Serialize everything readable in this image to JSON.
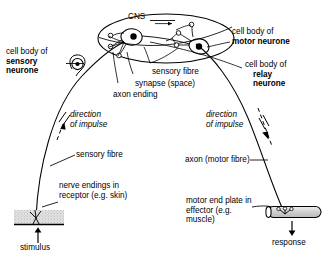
{
  "diagram": {
    "type": "biology-labelled-diagram",
    "colors": {
      "stroke": "#000000",
      "background": "#ffffff",
      "receptor_fill": "#d9d9d9",
      "effector_fill": "#d0d0d0",
      "cell_body_fill": "#000000"
    }
  },
  "labels": {
    "cns": "CNS",
    "cell_body_sensory": {
      "line1": "cell body of",
      "line2": "sensory",
      "line3": "neurone"
    },
    "cell_body_motor": {
      "line1": "cell body of",
      "line2": "motor neurone"
    },
    "cell_body_relay": {
      "line1": "cell body of",
      "line2": "relay",
      "line3": "neurone"
    },
    "sensory_fibre_cns": "sensory fibre",
    "synapse": "synapse (space)",
    "axon_ending": "axon ending",
    "direction_left": {
      "line1": "direction",
      "line2": "of impulse"
    },
    "direction_right": {
      "line1": "direction",
      "line2": "of impulse"
    },
    "sensory_fibre": "sensory fibre",
    "axon_motor_fibre": "axon (motor fibre)",
    "nerve_endings": {
      "line1": "nerve endings in",
      "line2": "receptor (e.g. skin)"
    },
    "motor_end_plate": {
      "line1": "motor end plate in",
      "line2": "effector (e.g.",
      "line3": "muscle)"
    },
    "stimulus": "stimulus",
    "response": "response"
  },
  "icons": {
    "cns_arrow": "arrow-right-icon",
    "stimulus_arrow": "arrow-up-icon",
    "response_arrow": "arrow-down-icon",
    "impulse_arrow_left": "arrow-up-icon",
    "impulse_arrow_right": "arrow-down-icon"
  },
  "structures": {
    "receptor": "stippled-skin-block",
    "effector": "shaded-muscle-cylinder",
    "cns_outline": "ellipse",
    "sensory_cell_body": "filled-circle-in-ring",
    "relay_cell_body": "filled-circle",
    "motor_cell_body": "filled-circle"
  }
}
